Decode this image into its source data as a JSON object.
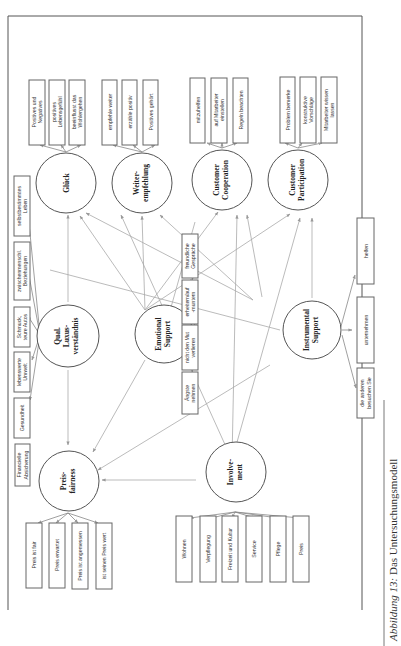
{
  "caption": {
    "label": "Abbildung 13",
    "separator": ":",
    "text": " Das Untersuchungsmodell"
  },
  "constructs": {
    "glueck": {
      "lines": [
        "Glück"
      ]
    },
    "weiterempfehlung": {
      "lines": [
        "Weiter-",
        "empfehlung"
      ]
    },
    "customer_cooperation": {
      "lines": [
        "Customer",
        "Cooperation"
      ]
    },
    "customer_participation": {
      "lines": [
        "Customer",
        "Participation"
      ]
    },
    "qual_luxus": {
      "lines": [
        "Qual.",
        "Luxus-",
        "verständnis"
      ]
    },
    "emotional_support": {
      "lines": [
        "Emotional",
        "Support"
      ]
    },
    "instrumental_support": {
      "lines": [
        "Instrumental",
        "Support"
      ]
    },
    "preisfairness": {
      "lines": [
        "Preis-",
        "fairness"
      ]
    },
    "involvement": {
      "lines": [
        "Involve-",
        "ment"
      ]
    }
  },
  "indicators": {
    "glueck": [
      {
        "lines": [
          "Positives und",
          "Negatives"
        ]
      },
      {
        "lines": [
          "positives",
          "Lebensgefühl"
        ]
      },
      {
        "lines": [
          "beeinflusst das",
          "Wohlergehen"
        ]
      }
    ],
    "weiterempfehlung": [
      {
        "lines": [
          "empfehle weiter"
        ]
      },
      {
        "lines": [
          "erzähle positiv"
        ]
      },
      {
        "lines": [
          "Positives gehört"
        ]
      }
    ],
    "customer_cooperation": [
      {
        "lines": [
          "mitzuhelfen"
        ]
      },
      {
        "lines": [
          "auf Mitarbeiter",
          "einstellen"
        ]
      },
      {
        "lines": [
          "Regeln beachten"
        ]
      }
    ],
    "customer_participation": [
      {
        "lines": [
          "Problem bemerke"
        ]
      },
      {
        "lines": [
          "konstruktive",
          "Vorschläge"
        ]
      },
      {
        "lines": [
          "Mitarbeiter wissen",
          "lassen"
        ]
      }
    ],
    "qual_luxus": [
      {
        "lines": [
          "Financielle",
          "Absicherung"
        ]
      },
      {
        "lines": [
          "Gesundheit"
        ]
      },
      {
        "lines": [
          "lebenswerte",
          "Umwelt"
        ]
      },
      {
        "lines": [
          "Schmuck,",
          "teure Autos"
        ]
      },
      {
        "lines": [
          "zwischenmenschl.",
          "Beziehungen"
        ]
      },
      {
        "lines": [
          "selbstbestimmtes",
          "Leben"
        ]
      }
    ],
    "emotional_support": [
      {
        "lines": [
          "Ängste",
          "nehmen"
        ]
      },
      {
        "lines": [
          "nicht den Mut",
          "verlieren"
        ]
      },
      {
        "lines": [
          "erheitern/auf",
          "-muntern"
        ]
      },
      {
        "lines": [
          "freundliche",
          "Gespräche"
        ]
      }
    ],
    "instrumental_support": [
      {
        "lines": [
          "die anderen",
          "besuchen Sie"
        ]
      },
      {
        "lines": [
          "unternehmen"
        ]
      },
      {
        "lines": [
          "helfen"
        ]
      }
    ],
    "preisfairness": [
      {
        "lines": [
          "Preis ist fair"
        ]
      },
      {
        "lines": [
          "Preis erwartet"
        ]
      },
      {
        "lines": [
          "Preis ist angemessen"
        ]
      },
      {
        "lines": [
          "ist seinen Preis wert"
        ]
      }
    ],
    "involvement": [
      {
        "lines": [
          "Wohnen"
        ]
      },
      {
        "lines": [
          "Verpflegung"
        ]
      },
      {
        "lines": [
          "Freizeit und Kultur"
        ]
      },
      {
        "lines": [
          "Service"
        ]
      },
      {
        "lines": [
          "Pflege"
        ]
      },
      {
        "lines": [
          "Preis"
        ]
      }
    ]
  }
}
